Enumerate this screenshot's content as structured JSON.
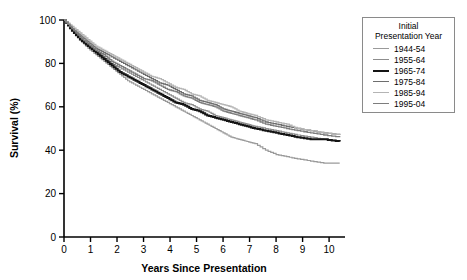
{
  "chart_data": {
    "type": "line",
    "title": "",
    "xlabel": "Years Since Presentation",
    "ylabel": "Survival (%)",
    "xlim": [
      0,
      10.6
    ],
    "ylim": [
      0,
      100
    ],
    "xticks": [
      "0",
      "1",
      "2",
      "3",
      "4",
      "5",
      "6",
      "7",
      "8",
      "9",
      "10"
    ],
    "yticks": [
      "0",
      "20",
      "40",
      "60",
      "80",
      "100"
    ],
    "grid": false,
    "step_type": "kaplan-meier",
    "legend": {
      "position": "top-right-outside",
      "title_line1": "Initial",
      "title_line2": "Presentation Year"
    },
    "series": [
      {
        "name": "1944-54",
        "color": "#9a9a9a",
        "width": 1.2,
        "x": [
          0,
          0.3,
          0.6,
          0.9,
          1.2,
          1.5,
          1.8,
          2.1,
          2.4,
          2.7,
          3.0,
          3.3,
          3.6,
          3.9,
          4.2,
          4.5,
          4.8,
          5.1,
          5.4,
          5.7,
          6.0,
          6.3,
          6.6,
          6.9,
          7.2,
          7.6,
          8.0,
          8.4,
          8.8,
          9.3,
          9.8,
          10.4
        ],
        "y": [
          100,
          95,
          91,
          87,
          84,
          81,
          78,
          75,
          72,
          70,
          68,
          66,
          64,
          62,
          60,
          58,
          56,
          54,
          52,
          50,
          48,
          46,
          45,
          44,
          43,
          40,
          38,
          37,
          36,
          35,
          34,
          34
        ]
      },
      {
        "name": "1955-64",
        "color": "#8d8d8d",
        "width": 1.2,
        "x": [
          0,
          0.3,
          0.6,
          0.9,
          1.2,
          1.5,
          1.8,
          2.1,
          2.4,
          2.7,
          3.0,
          3.3,
          3.6,
          3.9,
          4.2,
          4.5,
          4.8,
          5.1,
          5.4,
          5.7,
          6.0,
          6.3,
          6.6,
          6.9,
          7.2,
          7.6,
          8.0,
          8.4,
          8.8,
          9.3,
          9.8,
          10.4
        ],
        "y": [
          100,
          96,
          92,
          89,
          86,
          83,
          80,
          78,
          76,
          74,
          72,
          70,
          68,
          66,
          64,
          62,
          61,
          59,
          58,
          56,
          55,
          54,
          53,
          52,
          51,
          50,
          49,
          48,
          47,
          46,
          45,
          44
        ]
      },
      {
        "name": "1965-74",
        "color": "#141414",
        "width": 2.0,
        "x": [
          0,
          0.3,
          0.6,
          0.9,
          1.2,
          1.5,
          1.8,
          2.1,
          2.4,
          2.7,
          3.0,
          3.3,
          3.6,
          3.9,
          4.2,
          4.5,
          4.8,
          5.1,
          5.4,
          5.7,
          6.0,
          6.3,
          6.6,
          6.9,
          7.2,
          7.6,
          8.0,
          8.4,
          8.8,
          9.3,
          9.8,
          10.4
        ],
        "y": [
          100,
          95,
          91,
          88,
          85,
          82,
          79,
          76,
          74,
          72,
          70,
          68,
          66,
          64,
          62,
          61,
          59,
          58,
          56,
          55,
          54,
          53,
          52,
          51,
          50,
          49,
          48,
          47,
          46,
          45,
          45,
          44
        ]
      },
      {
        "name": "1975-84",
        "color": "#6e6e6e",
        "width": 1.3,
        "x": [
          0,
          0.3,
          0.6,
          0.9,
          1.2,
          1.5,
          1.8,
          2.1,
          2.4,
          2.7,
          3.0,
          3.3,
          3.6,
          3.9,
          4.2,
          4.5,
          4.8,
          5.1,
          5.4,
          5.7,
          6.0,
          6.3,
          6.6,
          6.9,
          7.2,
          7.6,
          8.0,
          8.4,
          8.8,
          9.3,
          9.8,
          10.4
        ],
        "y": [
          100,
          96,
          93,
          90,
          87,
          85,
          83,
          81,
          79,
          77,
          75,
          73,
          71,
          70,
          68,
          66,
          65,
          63,
          62,
          61,
          59,
          58,
          57,
          56,
          55,
          53,
          52,
          51,
          50,
          49,
          48,
          47
        ]
      },
      {
        "name": "1985-94",
        "color": "#b4b4b4",
        "width": 1.3,
        "x": [
          0,
          0.3,
          0.6,
          0.9,
          1.2,
          1.5,
          1.8,
          2.1,
          2.4,
          2.7,
          3.0,
          3.3,
          3.6,
          3.9,
          4.2,
          4.5,
          4.8,
          5.1,
          5.4,
          5.7,
          6.0,
          6.3,
          6.6,
          6.9,
          7.2,
          7.6,
          8.0,
          8.4,
          8.8,
          9.3,
          9.8,
          10.4
        ],
        "y": [
          100,
          97,
          94,
          91,
          88,
          86,
          84,
          82,
          80,
          78,
          76,
          74,
          73,
          71,
          69,
          68,
          66,
          65,
          63,
          62,
          61,
          60,
          58,
          57,
          56,
          54,
          53,
          52,
          50,
          49,
          48,
          47
        ]
      },
      {
        "name": "1995-04",
        "color": "#7d7d7d",
        "width": 1.3,
        "x": [
          0,
          0.3,
          0.6,
          0.9,
          1.2,
          1.5,
          1.8,
          2.1,
          2.4,
          2.7,
          3.0,
          3.3,
          3.6,
          3.9,
          4.2,
          4.5,
          4.8,
          5.1,
          5.4,
          5.7,
          6.0,
          6.3,
          6.6,
          6.9,
          7.2,
          7.6,
          8.0,
          8.4,
          8.8,
          9.3,
          9.8,
          10.4
        ],
        "y": [
          100,
          96,
          92,
          89,
          86,
          84,
          81,
          79,
          77,
          75,
          73,
          72,
          70,
          68,
          67,
          65,
          64,
          62,
          61,
          60,
          58,
          57,
          56,
          55,
          54,
          52,
          51,
          50,
          49,
          48,
          47,
          46
        ]
      }
    ]
  }
}
